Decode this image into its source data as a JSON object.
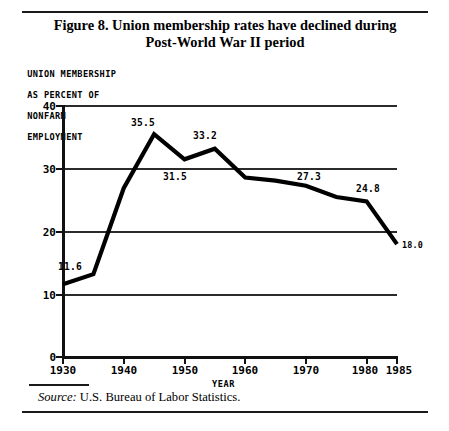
{
  "figure": {
    "title_line1": "Figure 8.  Union membership rates have declined during",
    "title_line2": "Post-World War II period",
    "source_prefix": "Source:",
    "source_text": "U.S. Bureau of Labor Statistics.",
    "rule_color": "#1a1a1a"
  },
  "chart_data": {
    "type": "line",
    "title": "Figure 8.  Union membership rates have declined during Post-World War II period",
    "ylabel_lines": [
      "UNION MEMBERSHIP",
      "AS PERCENT OF",
      "NONFARM",
      "EMPLOYMENT"
    ],
    "ylabel": "UNION MEMBERSHIP AS PERCENT OF NONFARM EMPLOYMENT",
    "xlabel": "YEAR",
    "xlim": [
      1930,
      1985
    ],
    "ylim": [
      0,
      40
    ],
    "yticks": [
      0,
      10,
      20,
      30,
      40
    ],
    "ytick_labels": [
      "0",
      "10",
      "20",
      "30",
      "40"
    ],
    "xticks": [
      1930,
      1940,
      1950,
      1960,
      1970,
      1980,
      1985
    ],
    "xtick_labels": [
      "1930",
      "1940",
      "1950",
      "1960",
      "1970",
      "1980",
      "1985"
    ],
    "grid": "horizontal",
    "gridlines": [
      10,
      20,
      30,
      40
    ],
    "legend": "none",
    "line_color": "#000000",
    "line_width": 4,
    "x": [
      1930,
      1935,
      1940,
      1945,
      1950,
      1955,
      1960,
      1965,
      1970,
      1975,
      1980,
      1985
    ],
    "values": [
      11.6,
      13.2,
      26.9,
      35.5,
      31.5,
      33.2,
      28.6,
      28.1,
      27.3,
      25.5,
      24.8,
      18.0
    ],
    "annotations": [
      {
        "x": 1930,
        "y": 11.6,
        "text": "11.6"
      },
      {
        "x": 1945,
        "y": 35.5,
        "text": "35.5"
      },
      {
        "x": 1950,
        "y": 31.5,
        "text": "31.5"
      },
      {
        "x": 1955,
        "y": 33.2,
        "text": "33.2"
      },
      {
        "x": 1970,
        "y": 27.3,
        "text": "27.3"
      },
      {
        "x": 1980,
        "y": 24.8,
        "text": "24.8"
      },
      {
        "x": 1985,
        "y": 18.0,
        "text": "18.0"
      }
    ]
  },
  "axis_labels": {
    "y0": "0",
    "y10": "10",
    "y20": "20",
    "y30": "30",
    "y40": "40",
    "x1930": "1930",
    "x1940": "1940",
    "x1950": "1950",
    "x1960": "1960",
    "x1970": "1970",
    "x1980": "1980",
    "x1985": "1985",
    "year": "YEAR",
    "ylab1": "UNION MEMBERSHIP",
    "ylab2": "AS PERCENT OF",
    "ylab3": "NONFARM",
    "ylab4": "EMPLOYMENT"
  },
  "point_labels": {
    "p1930": "11.6",
    "p1945": "35.5",
    "p1950": "31.5",
    "p1955": "33.2",
    "p1970": "27.3",
    "p1980": "24.8",
    "p1985": "18.0"
  }
}
